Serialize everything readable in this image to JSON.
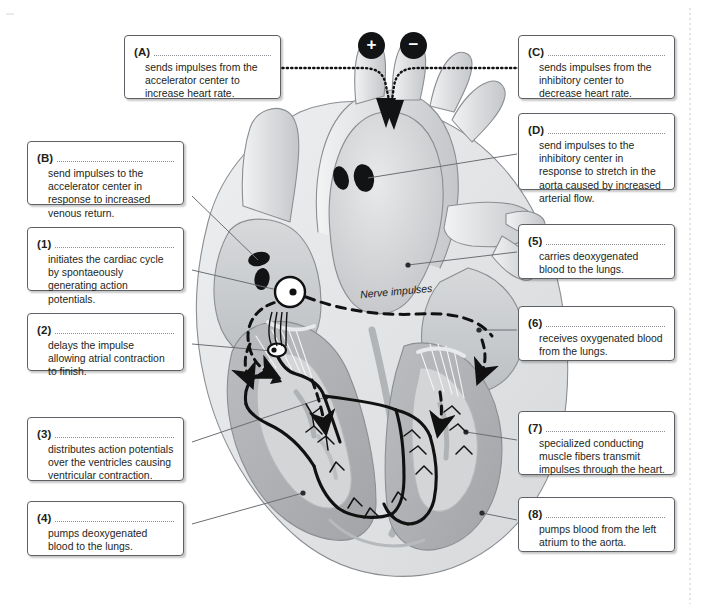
{
  "figure": {
    "nerve_label": "Nerve impulses",
    "badges": [
      {
        "name": "plus-badge",
        "symbol": "+"
      },
      {
        "name": "minus-badge",
        "symbol": "−"
      }
    ]
  },
  "callouts": {
    "a": {
      "tag": "(A)",
      "text": "sends impulses from the accelerator center to increase heart rate."
    },
    "b": {
      "tag": "(B)",
      "text": "send impulses to the accelerator center in response to increased venous return."
    },
    "c": {
      "tag": "(C)",
      "text": "sends impulses from the inhibitory center to decrease heart rate."
    },
    "d": {
      "tag": "(D)",
      "text": "send impulses to the inhibitory center in response to stretch in the aorta caused by increased arterial flow."
    },
    "n1": {
      "tag": "(1)",
      "text": "initiates the cardiac cycle by spontaeously generating action potentials."
    },
    "n2": {
      "tag": "(2)",
      "text": "delays the impulse allowing atrial contraction to finish."
    },
    "n3": {
      "tag": "(3)",
      "text": "distributes action potentials over the ventricles causing ventricular contraction."
    },
    "n4": {
      "tag": "(4)",
      "text": "pumps deoxygenated blood to the lungs."
    },
    "n5": {
      "tag": "(5)",
      "text": "carries deoxygenated blood to the lungs."
    },
    "n6": {
      "tag": "(6)",
      "text": "receives oxygenated blood from the lungs."
    },
    "n7": {
      "tag": "(7)",
      "text": "specialized conducting muscle fibers transmit impulses through the heart."
    },
    "n8": {
      "tag": "(8)",
      "text": "pumps blood from the left atrium to the aorta."
    }
  },
  "colors": {
    "box_border": "#5d6166",
    "text": "#1d1f21",
    "rule": "#8d9196",
    "badge_fill": "#111315",
    "conduction": "#111111",
    "leader": "#6b6f74",
    "heart_light": "#e3e4e6",
    "heart_mid": "#c9cbcd",
    "heart_dark": "#a9abae",
    "heart_outline": "#8b8e92"
  }
}
